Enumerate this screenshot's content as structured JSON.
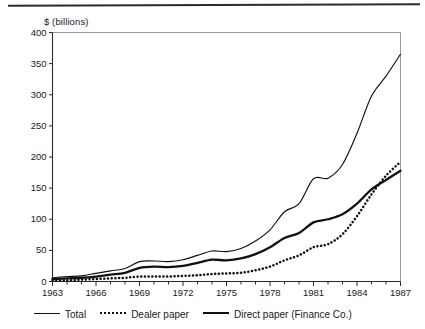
{
  "figure": {
    "y_axis_title": "$ (billions)"
  },
  "legend": {
    "items": [
      {
        "label": "Total",
        "style": "solid-thin",
        "swatch_name": "legend-swatch-total"
      },
      {
        "label": "Dealer paper",
        "style": "dotted",
        "swatch_name": "legend-swatch-dealer-paper"
      },
      {
        "label": "Direct paper (Finance Co.)",
        "style": "solid-thick",
        "swatch_name": "legend-swatch-direct-paper"
      }
    ]
  },
  "chart_data": {
    "type": "line",
    "title": "",
    "xlabel": "",
    "ylabel": "$ (billions)",
    "xlim": [
      1963,
      1987
    ],
    "ylim": [
      0,
      400
    ],
    "grid": false,
    "legend_position": "below",
    "y_ticks": [
      0,
      50,
      100,
      150,
      200,
      250,
      300,
      350,
      400
    ],
    "x_ticks_major": [
      1963,
      1966,
      1969,
      1972,
      1975,
      1978,
      1981,
      1984,
      1987
    ],
    "x_minor_tick_interval": 1,
    "x": [
      1963,
      1964,
      1965,
      1966,
      1967,
      1968,
      1969,
      1970,
      1971,
      1972,
      1973,
      1974,
      1975,
      1976,
      1977,
      1978,
      1979,
      1980,
      1981,
      1982,
      1983,
      1984,
      1985,
      1986,
      1987
    ],
    "series": [
      {
        "name": "Total",
        "style": "solid-thin",
        "values": [
          6,
          8,
          9,
          13,
          17,
          21,
          32,
          33,
          32,
          35,
          42,
          49,
          48,
          53,
          65,
          83,
          112,
          125,
          165,
          166,
          188,
          238,
          298,
          330,
          365
        ]
      },
      {
        "name": "Dealer paper",
        "style": "dotted",
        "values": [
          2,
          2,
          3,
          4,
          5,
          6,
          8,
          8,
          8,
          9,
          10,
          12,
          13,
          14,
          18,
          24,
          34,
          42,
          55,
          60,
          76,
          105,
          140,
          170,
          192
        ]
      },
      {
        "name": "Direct paper (Finance Co.)",
        "style": "solid-thick",
        "values": [
          4,
          5,
          6,
          8,
          11,
          14,
          22,
          24,
          23,
          25,
          30,
          35,
          34,
          37,
          44,
          55,
          70,
          78,
          95,
          100,
          108,
          125,
          148,
          163,
          178
        ]
      }
    ]
  }
}
